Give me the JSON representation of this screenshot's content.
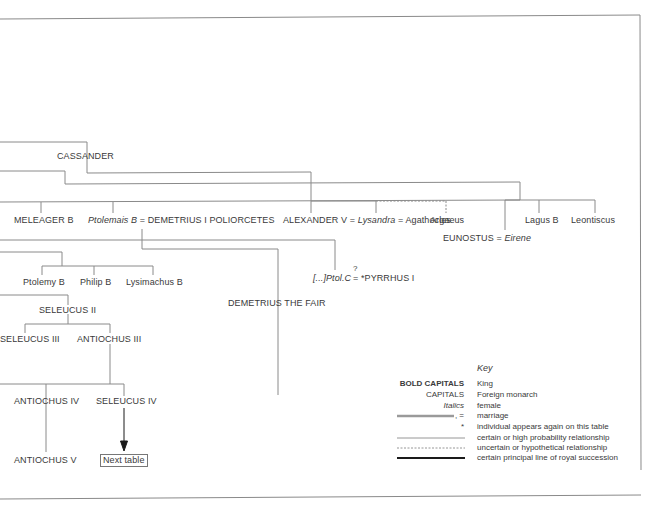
{
  "diagram": {
    "type": "genealogical-table",
    "nodes": {
      "cassander": "CASSANDER",
      "meleager": "MELEAGER B",
      "ptolemais": "Ptolemais B",
      "eq1": " = ",
      "demetrius1": "DEMETRIUS I POLIORCETES",
      "alexander5": "ALEXANDER V",
      "eq2": " = ",
      "lysandra": "Lysandra",
      "eq3": " = Agathocles",
      "argaeus": "Argaeus",
      "lagus": "Lagus B",
      "leontiscus": "Leontiscus",
      "eunostus": "EUNOSTUS = ",
      "eirene": "Eirene",
      "ptolemy_b": "Ptolemy B",
      "philip_b": "Philip B",
      "lysimachus_b": "Lysimachus B",
      "ptolc": "[...]Ptol.C",
      "question": "?",
      "pyrrhus": "= *PYRRHUS I",
      "demetrius_fair": "DEMETRIUS THE FAIR",
      "seleucus2": "SELEUCUS II",
      "seleucus3": "SELEUCUS III",
      "antiochus3": "ANTIOCHUS III",
      "antiochus4": "ANTIOCHUS IV",
      "seleucus4": "SELEUCUS IV",
      "antiochus5": "ANTIOCHUS V",
      "next_table": "Next  table"
    },
    "key": {
      "title": "Key",
      "rows": [
        {
          "symbol": "BOLD CAPITALS",
          "meaning": "King"
        },
        {
          "symbol": "CAPITALS",
          "meaning": "Foreign monarch"
        },
        {
          "symbol": "Italics",
          "meaning": "female"
        },
        {
          "symbol": ", =",
          "meaning": "marriage"
        },
        {
          "symbol": "*",
          "meaning": "individual appears again on this table"
        },
        {
          "symbol": "",
          "meaning": "certain or high probability relationship"
        },
        {
          "symbol": "",
          "meaning": "uncertain or hypothetical relationship"
        },
        {
          "symbol": "",
          "meaning": "certain principal line of royal succession"
        }
      ]
    },
    "colors": {
      "line": "#8a8a8a",
      "text": "#3a3a3a",
      "thick_line": "#1a1a1a"
    }
  }
}
